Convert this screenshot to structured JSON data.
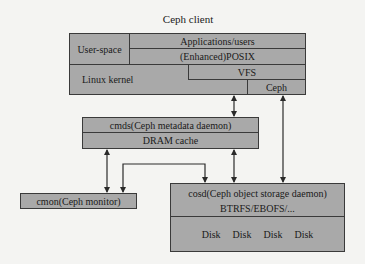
{
  "client": {
    "title": "Ceph client",
    "user_space": "User-space",
    "applications": "Applications/users",
    "posix": "(Enhanced)POSIX",
    "linux_kernel": "Linux kernel",
    "vfs": "VFS",
    "ceph": "Ceph"
  },
  "cmds": {
    "label": "cmds(Ceph metadata daemon)",
    "cache": "DRAM cache"
  },
  "cmon": {
    "label": "cmon(Ceph monitor)"
  },
  "cosd": {
    "label": "cosd(Ceph object storage daemon)",
    "fs": "BTRFS/EBOFS/...",
    "disks": [
      "Disk",
      "Disk",
      "Disk",
      "Disk"
    ]
  },
  "colors": {
    "box_fill": "#a9a9a9",
    "line": "#3a3a3a",
    "background": "#f4f4f2"
  }
}
